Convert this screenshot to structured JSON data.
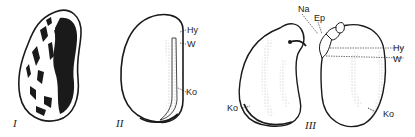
{
  "figures": [
    {
      "id": "I",
      "numeral": "I",
      "description": "Whole bean seed with mottled seed coat"
    },
    {
      "id": "II",
      "numeral": "II",
      "description": "Seed with seed coat removed, side view",
      "labels": {
        "hy": "Hy",
        "w": "W",
        "ko": "Ko"
      }
    },
    {
      "id": "III",
      "numeral": "III",
      "description": "Embryo opened showing two cotyledons",
      "labels": {
        "na": "Na",
        "ep": "Ep",
        "hy": "Hy",
        "w": "W",
        "ko_left": "Ko",
        "ko_right": "Ko"
      }
    }
  ],
  "colors": {
    "ink": "#1a1a1a",
    "background": "#ffffff",
    "stipple": "#888888"
  }
}
